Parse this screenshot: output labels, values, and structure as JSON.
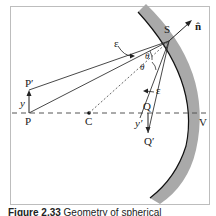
{
  "figure": {
    "labels": {
      "P": "P",
      "P_prime": "P′",
      "y": "y",
      "C": "C",
      "Q": "Q",
      "Q_prime": "Q′",
      "y_prime": "y′",
      "S": "S",
      "n_hat": "n̂",
      "V": "V",
      "epsilon_upper": "ε",
      "epsilon_lower": "ε",
      "theta_1": "θ",
      "theta_2": "θ"
    },
    "caption": {
      "number": "Figure 2.33",
      "text": "Geometry of spherical"
    },
    "colors": {
      "mirror_fill": "#a9a9a9",
      "mirror_edge": "#111111",
      "frame": "#bdbdbd",
      "lines": "#333333"
    }
  }
}
